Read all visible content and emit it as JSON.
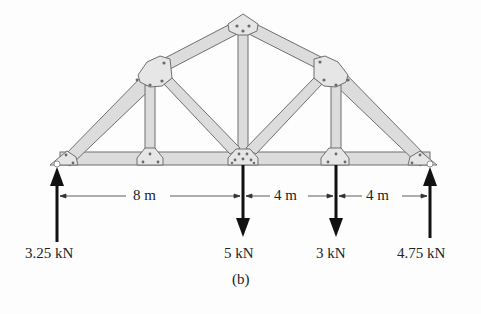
{
  "figure": {
    "caption": "(b)",
    "type": "roof truss free-body diagram"
  },
  "loads": {
    "left_reaction": {
      "label": "3.25 kN",
      "direction": "up"
    },
    "load_center": {
      "label": "5 kN",
      "direction": "down"
    },
    "load_right": {
      "label": "3 kN",
      "direction": "down"
    },
    "right_reaction": {
      "label": "4.75 kN",
      "direction": "up"
    }
  },
  "dimensions": {
    "span_1": "8 m",
    "span_2": "4 m",
    "span_3": "4 m"
  },
  "colors": {
    "member_fill": "#dcdcdc",
    "member_stroke": "#6f6f6f",
    "plate_fill": "#e6e6e6",
    "arrow": "#111111",
    "text": "#222222"
  }
}
